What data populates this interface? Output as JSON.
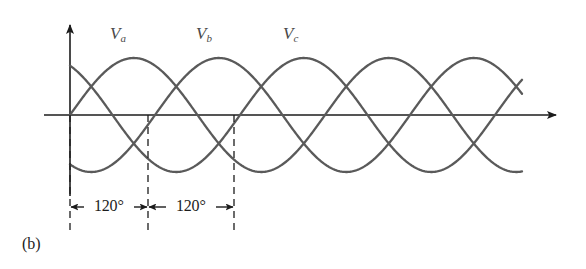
{
  "figure": {
    "caption": "(b)",
    "labels": {
      "va_base": "V",
      "va_sub": "a",
      "vb_base": "V",
      "vb_sub": "b",
      "vc_base": "V",
      "vc_sub": "c"
    },
    "angle_annotations": [
      {
        "text": "120°"
      },
      {
        "text": "120°"
      }
    ],
    "colors": {
      "curve": "#5a5a5a",
      "axis": "#1c1c1c",
      "dashed": "#1c1c1c",
      "label": "#4a4a4a",
      "background": "#ffffff"
    }
  },
  "chart_data": {
    "type": "line",
    "title": "",
    "subtitle": "",
    "xlabel": "",
    "ylabel": "",
    "grid": false,
    "legend": "inline-curve-labels",
    "axes": {
      "x_axis_y_px": 115,
      "y_axis_x_px": 70,
      "x_start_px": 70,
      "x_end_px": 560,
      "y_top_px": 19,
      "amplitude_px": 57,
      "period_px": 255,
      "phase_step_deg": 120
    },
    "x_unit": "degrees",
    "x_range_deg": [
      0,
      630
    ],
    "y_range": [
      -1,
      1
    ],
    "series": [
      {
        "name": "Va",
        "label": "V_a",
        "phase_deg": 0,
        "amplitude": 1,
        "color": "#5a5a5a",
        "label_x_px": 110,
        "label_y_px": 25,
        "peak_x_px": 130,
        "trough_x_px": 193
      },
      {
        "name": "Vb",
        "label": "V_b",
        "phase_deg": -120,
        "amplitude": 1,
        "color": "#5a5a5a",
        "label_x_px": 196,
        "label_y_px": 25,
        "peak_x_px": 215,
        "trough_x_px": 278
      },
      {
        "name": "Vc",
        "label": "V_c",
        "phase_deg": -240,
        "amplitude": 1,
        "color": "#5a5a5a",
        "label_x_px": 283,
        "label_y_px": 25,
        "peak_x_px": 300,
        "trough_x_px": 363
      }
    ],
    "markers": {
      "dashed_lines_x_px": [
        70,
        148,
        234
      ],
      "dashed_top_px": 115,
      "dashed_bottom_px": 232
    },
    "annotations": [
      {
        "text": "120°",
        "from_x_px": 70,
        "to_x_px": 148,
        "y_px": 207
      },
      {
        "text": "120°",
        "from_x_px": 148,
        "to_x_px": 234,
        "y_px": 207
      }
    ]
  }
}
